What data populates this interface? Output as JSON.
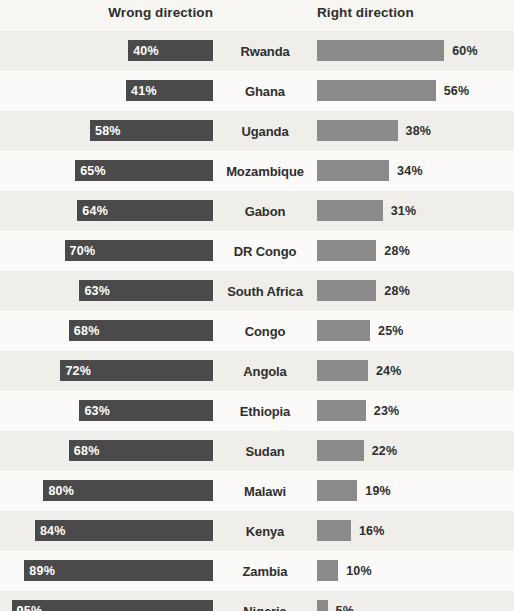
{
  "header": {
    "left_label": "Wrong direction",
    "right_label": "Right direction"
  },
  "colors": {
    "background": "#f7f6f3",
    "left_bar": "#4a4a4a",
    "right_bar": "#8a8a8a",
    "text": "#2e2e2e",
    "left_bar_text": "#ffffff"
  },
  "chart_data": {
    "type": "bar",
    "title": "",
    "subtitle": "",
    "xlabel": "",
    "ylabel": "",
    "orientation": "horizontal",
    "layout": "diverging",
    "grid": false,
    "legend_position": "top",
    "xlim": [
      0,
      100
    ],
    "unit": "%",
    "categories": [
      "Rwanda",
      "Ghana",
      "Uganda",
      "Mozambique",
      "Gabon",
      "DR Congo",
      "South Africa",
      "Congo",
      "Angola",
      "Ethiopia",
      "Sudan",
      "Malawi",
      "Kenya",
      "Zambia",
      "Nigeria"
    ],
    "series": [
      {
        "name": "Wrong direction",
        "side": "left",
        "color": "#4a4a4a",
        "values": [
          40,
          41,
          58,
          65,
          64,
          70,
          63,
          68,
          72,
          63,
          68,
          80,
          84,
          89,
          95
        ],
        "labels": [
          "40%",
          "41%",
          "58%",
          "65%",
          "64%",
          "70%",
          "63%",
          "68%",
          "72%",
          "63%",
          "68%",
          "80%",
          "84%",
          "89%",
          "95%"
        ]
      },
      {
        "name": "Right direction",
        "side": "right",
        "color": "#8a8a8a",
        "values": [
          60,
          56,
          38,
          34,
          31,
          28,
          28,
          25,
          24,
          23,
          22,
          19,
          16,
          10,
          5
        ],
        "labels": [
          "60%",
          "56%",
          "38%",
          "34%",
          "31%",
          "28%",
          "28%",
          "25%",
          "24%",
          "23%",
          "22%",
          "19%",
          "16%",
          "10%",
          "5%"
        ]
      }
    ]
  },
  "rows": [
    {
      "country": "Rwanda",
      "wrong": "40%",
      "right": "60%"
    },
    {
      "country": "Ghana",
      "wrong": "41%",
      "right": "56%"
    },
    {
      "country": "Uganda",
      "wrong": "58%",
      "right": "38%"
    },
    {
      "country": "Mozambique",
      "wrong": "65%",
      "right": "34%"
    },
    {
      "country": "Gabon",
      "wrong": "64%",
      "right": "31%"
    },
    {
      "country": "DR Congo",
      "wrong": "70%",
      "right": "28%"
    },
    {
      "country": "South Africa",
      "wrong": "63%",
      "right": "28%"
    },
    {
      "country": "Congo",
      "wrong": "68%",
      "right": "25%"
    },
    {
      "country": "Angola",
      "wrong": "72%",
      "right": "24%"
    },
    {
      "country": "Ethiopia",
      "wrong": "63%",
      "right": "23%"
    },
    {
      "country": "Sudan",
      "wrong": "68%",
      "right": "22%"
    },
    {
      "country": "Malawi",
      "wrong": "80%",
      "right": "19%"
    },
    {
      "country": "Kenya",
      "wrong": "84%",
      "right": "16%"
    },
    {
      "country": "Zambia",
      "wrong": "89%",
      "right": "10%"
    },
    {
      "country": "Nigeria",
      "wrong": "95%",
      "right": "5%"
    }
  ]
}
